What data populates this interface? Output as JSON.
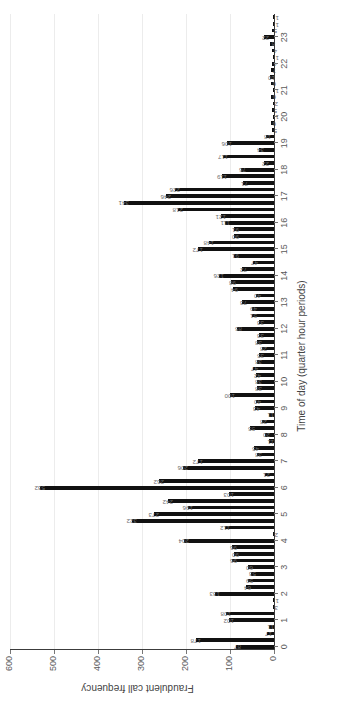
{
  "chart_data": {
    "type": "bar",
    "title": "",
    "xlabel": "Time of day (quarter hour periods)",
    "ylabel": "Fraudulent call frequency",
    "ylim": [
      0,
      600
    ],
    "ytick_values": [
      0,
      100,
      200,
      300,
      400,
      500,
      600
    ],
    "xtick_labels": [
      "0",
      "1",
      "2",
      "3",
      "4",
      "5",
      "6",
      "7",
      "8",
      "9",
      "10",
      "11",
      "12",
      "13",
      "14",
      "15",
      "16",
      "17",
      "18",
      "19",
      "20",
      "21",
      "22",
      "23"
    ],
    "grid": "vertical-light",
    "legend": "none",
    "bar_color": "#111111",
    "label_color": "#6b6b6b",
    "axis_color": "#3c3c3c",
    "n_bars": 96,
    "note": "Each hour on the x-axis contains four quarter-hour bars.",
    "categories": [
      "0.00",
      "0.25",
      "0.50",
      "0.75",
      "1.00",
      "1.25",
      "1.50",
      "1.75",
      "2.00",
      "2.25",
      "2.50",
      "2.75",
      "3.00",
      "3.25",
      "3.50",
      "3.75",
      "4.00",
      "4.25",
      "4.50",
      "4.75",
      "5.00",
      "5.25",
      "5.50",
      "5.75",
      "6.00",
      "6.25",
      "6.50",
      "6.75",
      "7.00",
      "7.25",
      "7.50",
      "7.75",
      "8.00",
      "8.25",
      "8.50",
      "8.75",
      "9.00",
      "9.25",
      "9.50",
      "9.75",
      "10.00",
      "10.25",
      "10.50",
      "10.75",
      "11.00",
      "11.25",
      "11.50",
      "11.75",
      "12.00",
      "12.25",
      "12.50",
      "12.75",
      "13.00",
      "13.25",
      "13.50",
      "13.75",
      "14.00",
      "14.25",
      "14.50",
      "14.75",
      "15.00",
      "15.25",
      "15.50",
      "15.75",
      "16.00",
      "16.25",
      "16.50",
      "16.75",
      "17.00",
      "17.25",
      "17.50",
      "17.75",
      "18.00",
      "18.25",
      "18.50",
      "18.75",
      "19.00",
      "19.25",
      "19.50",
      "19.75",
      "20.00",
      "20.25",
      "20.50",
      "20.75",
      "21.00",
      "21.25",
      "21.50",
      "21.75",
      "22.00",
      "22.25",
      "22.50",
      "22.75",
      "23.00",
      "23.25",
      "23.50",
      "23.75"
    ],
    "values": [
      87,
      178,
      17,
      11,
      102,
      108,
      3,
      1,
      133,
      64,
      59,
      53,
      60,
      96,
      90,
      96,
      204,
      2,
      112,
      322,
      273,
      196,
      242,
      103,
      532,
      262,
      21,
      206,
      172,
      38,
      45,
      11,
      20,
      55,
      28,
      11,
      43,
      40,
      100,
      38,
      38,
      42,
      47,
      38,
      35,
      28,
      38,
      33,
      85,
      33,
      51,
      49,
      73,
      40,
      94,
      98,
      126,
      72,
      47,
      91,
      172,
      148,
      90,
      91,
      111,
      121,
      218,
      341,
      246,
      226,
      71,
      119,
      76,
      22,
      117,
      34,
      106,
      18,
      5,
      6,
      1,
      5,
      2,
      6,
      1,
      6,
      10,
      7,
      4,
      1,
      4,
      8,
      22,
      5,
      1,
      1
    ],
    "labels": [
      "87",
      "178",
      "17",
      "11",
      "102",
      "108",
      "3",
      "1",
      "133",
      "64",
      "59",
      "53",
      "60",
      "96",
      "90",
      "96",
      "204",
      "2",
      "112",
      "322",
      "273",
      "196",
      "242",
      "103",
      "532",
      "262",
      "21",
      "206",
      "172",
      "38",
      "45",
      "11",
      "20",
      "55",
      "28",
      "11",
      "43",
      "40",
      "100",
      "38",
      "38",
      "42",
      "47",
      "38",
      "35",
      "28",
      "38",
      "33",
      "85",
      "33",
      "51",
      "49",
      "73",
      "40",
      "94",
      "98",
      "126",
      "72",
      "47",
      "91",
      "172",
      "148",
      "90",
      "91",
      "111",
      "121",
      "218",
      "341",
      "246",
      "226",
      "71",
      "119",
      "76",
      "22",
      "117",
      "34",
      "106",
      "18",
      "5",
      "6",
      "1",
      "5",
      "2",
      "6",
      "1",
      "6",
      "10",
      "7",
      "4",
      "1",
      "4",
      "8",
      "22",
      "5",
      "1",
      "1"
    ]
  }
}
